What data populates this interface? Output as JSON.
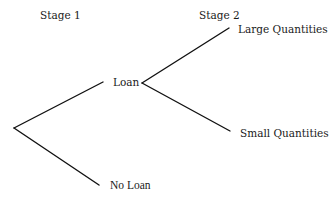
{
  "diagram": {
    "type": "decision-tree",
    "stages": [
      {
        "label": "Stage 1"
      },
      {
        "label": "Stage 2"
      }
    ],
    "nodes": {
      "root": {
        "label": ""
      },
      "loan": {
        "label": "Loan"
      },
      "no_loan": {
        "label": "No Loan"
      },
      "large": {
        "label": "Large Quantities"
      },
      "small": {
        "label": "Small Quantities"
      }
    },
    "edges": [
      {
        "from": "root",
        "to": "loan"
      },
      {
        "from": "root",
        "to": "no_loan"
      },
      {
        "from": "loan",
        "to": "large"
      },
      {
        "from": "loan",
        "to": "small"
      }
    ],
    "line_color": "#111111"
  }
}
